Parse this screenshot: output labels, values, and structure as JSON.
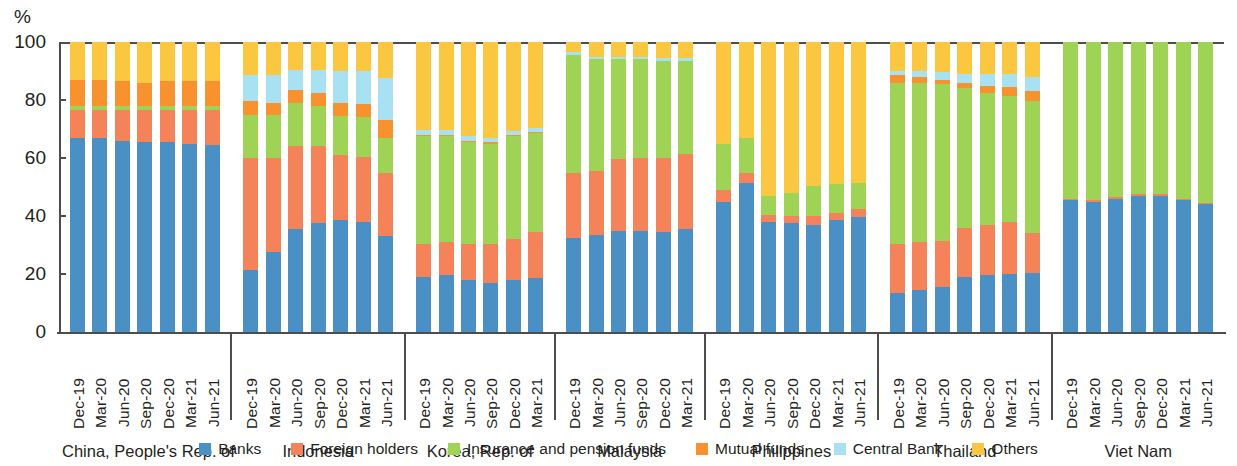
{
  "axis": {
    "unit_label": "%",
    "yticks": [
      0,
      20,
      40,
      60,
      80,
      100
    ],
    "ymin": 0,
    "ymax": 100
  },
  "legend": {
    "items": [
      {
        "label": "Banks",
        "color": "#4a90c4",
        "key": "banks"
      },
      {
        "label": "Foreign holders",
        "color": "#f4835a",
        "key": "foreign_holders"
      },
      {
        "label": "Insurance and pension funds",
        "color": "#9ed356",
        "key": "insurance_pension"
      },
      {
        "label": "Mutual funds",
        "color": "#f7922e",
        "key": "mutual_funds"
      },
      {
        "label": "Central Bank",
        "color": "#a8e2f2",
        "key": "central_bank"
      },
      {
        "label": "Others",
        "color": "#fbc740",
        "key": "others"
      }
    ]
  },
  "chart_data": {
    "type": "bar",
    "subtype": "stacked-100-percent",
    "title": "",
    "xlabel": "",
    "ylabel": "%",
    "ylim": [
      0,
      100
    ],
    "grid": false,
    "legend_position": "bottom-center",
    "series": [
      {
        "name": "Banks",
        "color": "#4a90c4"
      },
      {
        "name": "Foreign holders",
        "color": "#f4835a"
      },
      {
        "name": "Insurance and pension funds",
        "color": "#9ed356"
      },
      {
        "name": "Mutual funds",
        "color": "#f7922e"
      },
      {
        "name": "Central Bank",
        "color": "#a8e2f2"
      },
      {
        "name": "Others",
        "color": "#fbc740"
      }
    ],
    "groups": [
      {
        "name": "China, People's Rep. of",
        "categories": [
          "Dec-19",
          "Mar-20",
          "Jun-20",
          "Sep-20",
          "Dec-20",
          "Mar-21",
          "Jun-21"
        ],
        "bars": [
          {
            "category": "Dec-19",
            "banks": 67.0,
            "foreign_holders": 9.5,
            "insurance_pension": 1.5,
            "mutual_funds": 9.0,
            "central_bank": 0.0,
            "others": 13.0
          },
          {
            "category": "Mar-20",
            "banks": 67.0,
            "foreign_holders": 9.5,
            "insurance_pension": 1.5,
            "mutual_funds": 9.0,
            "central_bank": 0.0,
            "others": 13.0
          },
          {
            "category": "Jun-20",
            "banks": 66.0,
            "foreign_holders": 10.5,
            "insurance_pension": 1.5,
            "mutual_funds": 8.5,
            "central_bank": 0.0,
            "others": 13.5
          },
          {
            "category": "Sep-20",
            "banks": 65.5,
            "foreign_holders": 11.0,
            "insurance_pension": 1.5,
            "mutual_funds": 8.0,
            "central_bank": 0.0,
            "others": 14.0
          },
          {
            "category": "Dec-20",
            "banks": 65.5,
            "foreign_holders": 11.0,
            "insurance_pension": 1.5,
            "mutual_funds": 8.5,
            "central_bank": 0.0,
            "others": 13.5
          },
          {
            "category": "Mar-21",
            "banks": 65.0,
            "foreign_holders": 11.5,
            "insurance_pension": 1.5,
            "mutual_funds": 8.5,
            "central_bank": 0.0,
            "others": 13.5
          },
          {
            "category": "Jun-21",
            "banks": 64.5,
            "foreign_holders": 12.0,
            "insurance_pension": 1.5,
            "mutual_funds": 8.5,
            "central_bank": 0.0,
            "others": 13.5
          }
        ]
      },
      {
        "name": "Indonesia",
        "categories": [
          "Dec-19",
          "Mar-20",
          "Jun-20",
          "Sep-20",
          "Dec-20",
          "Mar-21",
          "Jun-21"
        ],
        "bars": [
          {
            "category": "Dec-19",
            "banks": 21.5,
            "foreign_holders": 38.5,
            "insurance_pension": 15.0,
            "mutual_funds": 4.5,
            "central_bank": 9.0,
            "others": 11.5
          },
          {
            "category": "Mar-20",
            "banks": 27.5,
            "foreign_holders": 32.5,
            "insurance_pension": 15.0,
            "mutual_funds": 4.0,
            "central_bank": 9.5,
            "others": 11.5
          },
          {
            "category": "Jun-20",
            "banks": 35.5,
            "foreign_holders": 28.5,
            "insurance_pension": 15.0,
            "mutual_funds": 4.5,
            "central_bank": 7.0,
            "others": 9.5
          },
          {
            "category": "Sep-20",
            "banks": 37.5,
            "foreign_holders": 26.5,
            "insurance_pension": 14.0,
            "mutual_funds": 4.5,
            "central_bank": 8.0,
            "others": 9.5
          },
          {
            "category": "Dec-20",
            "banks": 38.5,
            "foreign_holders": 22.5,
            "insurance_pension": 13.5,
            "mutual_funds": 4.5,
            "central_bank": 11.0,
            "others": 10.0
          },
          {
            "category": "Mar-21",
            "banks": 38.0,
            "foreign_holders": 22.5,
            "insurance_pension": 13.5,
            "mutual_funds": 4.5,
            "central_bank": 11.5,
            "others": 10.0
          },
          {
            "category": "Jun-21",
            "banks": 33.0,
            "foreign_holders": 22.0,
            "insurance_pension": 12.0,
            "mutual_funds": 6.0,
            "central_bank": 14.5,
            "others": 12.5
          }
        ]
      },
      {
        "name": "Korea, Rep. of",
        "categories": [
          "Dec-19",
          "Mar-20",
          "Jun-20",
          "Sep-20",
          "Dec-20",
          "Mar-21"
        ],
        "bars": [
          {
            "category": "Dec-19",
            "banks": 19.0,
            "foreign_holders": 11.5,
            "insurance_pension": 37.0,
            "mutual_funds": 0.5,
            "central_bank": 1.5,
            "others": 30.5
          },
          {
            "category": "Mar-20",
            "banks": 19.5,
            "foreign_holders": 11.5,
            "insurance_pension": 36.5,
            "mutual_funds": 0.5,
            "central_bank": 1.5,
            "others": 30.5
          },
          {
            "category": "Jun-20",
            "banks": 18.0,
            "foreign_holders": 12.5,
            "insurance_pension": 35.0,
            "mutual_funds": 0.5,
            "central_bank": 1.5,
            "others": 32.5
          },
          {
            "category": "Sep-20",
            "banks": 17.0,
            "foreign_holders": 13.5,
            "insurance_pension": 34.5,
            "mutual_funds": 0.5,
            "central_bank": 1.5,
            "others": 33.0
          },
          {
            "category": "Dec-20",
            "banks": 18.0,
            "foreign_holders": 14.0,
            "insurance_pension": 35.5,
            "mutual_funds": 0.5,
            "central_bank": 1.5,
            "others": 30.5
          },
          {
            "category": "Mar-21",
            "banks": 18.5,
            "foreign_holders": 16.0,
            "insurance_pension": 34.0,
            "mutual_funds": 0.5,
            "central_bank": 1.5,
            "others": 29.5
          }
        ]
      },
      {
        "name": "Malaysia",
        "categories": [
          "Dec-19",
          "Mar-20",
          "Jun-20",
          "Sep-20",
          "Dec-20",
          "Mar-21"
        ],
        "bars": [
          {
            "category": "Dec-19",
            "banks": 32.5,
            "foreign_holders": 22.5,
            "insurance_pension": 40.5,
            "mutual_funds": 0.0,
            "central_bank": 1.0,
            "others": 3.5
          },
          {
            "category": "Mar-20",
            "banks": 33.5,
            "foreign_holders": 22.0,
            "insurance_pension": 38.5,
            "mutual_funds": 0.0,
            "central_bank": 1.0,
            "others": 5.0
          },
          {
            "category": "Jun-20",
            "banks": 35.0,
            "foreign_holders": 24.5,
            "insurance_pension": 34.5,
            "mutual_funds": 0.0,
            "central_bank": 1.0,
            "others": 5.0
          },
          {
            "category": "Sep-20",
            "banks": 35.0,
            "foreign_holders": 25.0,
            "insurance_pension": 34.0,
            "mutual_funds": 0.0,
            "central_bank": 1.0,
            "others": 5.0
          },
          {
            "category": "Dec-20",
            "banks": 34.5,
            "foreign_holders": 25.5,
            "insurance_pension": 33.5,
            "mutual_funds": 0.0,
            "central_bank": 1.0,
            "others": 5.5
          },
          {
            "category": "Mar-21",
            "banks": 35.5,
            "foreign_holders": 26.0,
            "insurance_pension": 32.0,
            "mutual_funds": 0.0,
            "central_bank": 1.0,
            "others": 5.5
          }
        ]
      },
      {
        "name": "Philippines",
        "categories": [
          "Dec-19",
          "Mar-20",
          "Jun-20",
          "Sep-20",
          "Dec-20",
          "Mar-21",
          "Jun-21"
        ],
        "bars": [
          {
            "category": "Dec-19",
            "banks": 45.0,
            "foreign_holders": 4.0,
            "insurance_pension": 16.0,
            "mutual_funds": 0.0,
            "central_bank": 0.0,
            "others": 35.0
          },
          {
            "category": "Mar-20",
            "banks": 51.5,
            "foreign_holders": 3.5,
            "insurance_pension": 12.0,
            "mutual_funds": 0.0,
            "central_bank": 0.0,
            "others": 33.0
          },
          {
            "category": "Jun-20",
            "banks": 38.0,
            "foreign_holders": 2.5,
            "insurance_pension": 6.5,
            "mutual_funds": 0.0,
            "central_bank": 0.0,
            "others": 53.0
          },
          {
            "category": "Sep-20",
            "banks": 37.5,
            "foreign_holders": 2.5,
            "insurance_pension": 8.0,
            "mutual_funds": 0.0,
            "central_bank": 0.0,
            "others": 52.0
          },
          {
            "category": "Dec-20",
            "banks": 37.0,
            "foreign_holders": 3.0,
            "insurance_pension": 10.5,
            "mutual_funds": 0.0,
            "central_bank": 0.0,
            "others": 49.5
          },
          {
            "category": "Mar-21",
            "banks": 38.5,
            "foreign_holders": 2.5,
            "insurance_pension": 10.0,
            "mutual_funds": 0.0,
            "central_bank": 0.0,
            "others": 49.0
          },
          {
            "category": "Jun-21",
            "banks": 39.5,
            "foreign_holders": 3.0,
            "insurance_pension": 9.0,
            "mutual_funds": 0.0,
            "central_bank": 0.0,
            "others": 48.5
          }
        ]
      },
      {
        "name": "Thailand",
        "categories": [
          "Dec-19",
          "Mar-20",
          "Jun-20",
          "Sep-20",
          "Dec-20",
          "Mar-21",
          "Jun-21"
        ],
        "bars": [
          {
            "category": "Dec-19",
            "banks": 13.5,
            "foreign_holders": 17.0,
            "insurance_pension": 55.5,
            "mutual_funds": 2.5,
            "central_bank": 1.5,
            "others": 10.0
          },
          {
            "category": "Mar-20",
            "banks": 14.5,
            "foreign_holders": 16.5,
            "insurance_pension": 55.0,
            "mutual_funds": 2.0,
            "central_bank": 2.0,
            "others": 10.0
          },
          {
            "category": "Jun-20",
            "banks": 15.5,
            "foreign_holders": 16.0,
            "insurance_pension": 54.0,
            "mutual_funds": 1.5,
            "central_bank": 2.5,
            "others": 10.5
          },
          {
            "category": "Sep-20",
            "banks": 19.0,
            "foreign_holders": 17.0,
            "insurance_pension": 48.0,
            "mutual_funds": 2.0,
            "central_bank": 3.0,
            "others": 11.0
          },
          {
            "category": "Dec-20",
            "banks": 19.5,
            "foreign_holders": 17.5,
            "insurance_pension": 45.5,
            "mutual_funds": 2.5,
            "central_bank": 4.0,
            "others": 11.0
          },
          {
            "category": "Mar-21",
            "banks": 20.0,
            "foreign_holders": 18.0,
            "insurance_pension": 43.5,
            "mutual_funds": 3.0,
            "central_bank": 4.5,
            "others": 11.0
          },
          {
            "category": "Jun-21",
            "banks": 20.5,
            "foreign_holders": 13.5,
            "insurance_pension": 45.5,
            "mutual_funds": 3.5,
            "central_bank": 5.0,
            "others": 12.0
          }
        ]
      },
      {
        "name": "Viet Nam",
        "categories": [
          "Dec-19",
          "Mar-20",
          "Jun-20",
          "Sep-20",
          "Dec-20",
          "Mar-21",
          "Jun-21"
        ],
        "bars": [
          {
            "category": "Dec-19",
            "banks": 45.5,
            "foreign_holders": 0.5,
            "insurance_pension": 54.0,
            "mutual_funds": 0.0,
            "central_bank": 0.0,
            "others": 0.0
          },
          {
            "category": "Mar-20",
            "banks": 45.0,
            "foreign_holders": 0.5,
            "insurance_pension": 54.5,
            "mutual_funds": 0.0,
            "central_bank": 0.0,
            "others": 0.0
          },
          {
            "category": "Jun-20",
            "banks": 46.0,
            "foreign_holders": 0.5,
            "insurance_pension": 53.5,
            "mutual_funds": 0.0,
            "central_bank": 0.0,
            "others": 0.0
          },
          {
            "category": "Sep-20",
            "banks": 47.0,
            "foreign_holders": 0.5,
            "insurance_pension": 52.5,
            "mutual_funds": 0.0,
            "central_bank": 0.0,
            "others": 0.0
          },
          {
            "category": "Dec-20",
            "banks": 47.0,
            "foreign_holders": 0.5,
            "insurance_pension": 52.5,
            "mutual_funds": 0.0,
            "central_bank": 0.0,
            "others": 0.0
          },
          {
            "category": "Mar-21",
            "banks": 45.5,
            "foreign_holders": 0.5,
            "insurance_pension": 54.0,
            "mutual_funds": 0.0,
            "central_bank": 0.0,
            "others": 0.0
          },
          {
            "category": "Jun-21",
            "banks": 44.0,
            "foreign_holders": 0.5,
            "insurance_pension": 55.5,
            "mutual_funds": 0.0,
            "central_bank": 0.0,
            "others": 0.0
          }
        ]
      }
    ]
  }
}
